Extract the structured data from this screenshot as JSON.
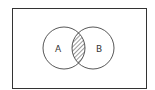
{
  "diagram": {
    "type": "venn",
    "universe_label": "",
    "sets": [
      {
        "label": "A",
        "cx": 64,
        "cy": 48,
        "r": 21
      },
      {
        "label": "B",
        "cx": 93,
        "cy": 48,
        "r": 21
      }
    ],
    "shaded_region": "A ∩ B",
    "colors": {
      "stroke": "#333333",
      "hatch": "#555555",
      "background": "#ffffff"
    }
  }
}
